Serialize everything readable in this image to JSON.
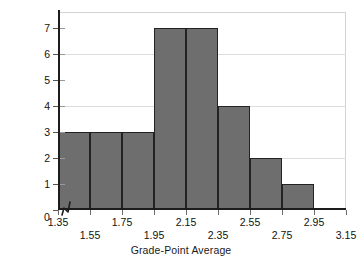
{
  "chart_data": {
    "type": "bar",
    "subtype": "histogram",
    "title": "",
    "xlabel": "Grade-Point Average",
    "ylabel": "Frequency f",
    "ylabel_subscript": "i",
    "categories": [
      "1.35-1.55",
      "1.55-1.75",
      "1.75-1.95",
      "1.95-2.15",
      "2.15-2.35",
      "2.35-2.55",
      "2.55-2.75",
      "2.75-2.95"
    ],
    "values": [
      3,
      3,
      3,
      7,
      7,
      4,
      2,
      1
    ],
    "bin_edges": [
      1.35,
      1.55,
      1.75,
      1.95,
      2.15,
      2.35,
      2.55,
      2.75,
      2.95
    ],
    "bin_width": 0.2,
    "xlim": [
      1.35,
      3.15
    ],
    "ylim": [
      0,
      7.6
    ],
    "xticks": [
      1.35,
      1.55,
      1.75,
      1.95,
      2.15,
      2.35,
      2.55,
      2.75,
      2.95,
      3.15
    ],
    "xticklabels": [
      "1.35",
      "1.55",
      "1.75",
      "1.95",
      "2.15",
      "2.35",
      "2.55",
      "2.75",
      "2.95",
      "3.15"
    ],
    "xticklabel_rows": [
      0,
      1,
      0,
      1,
      0,
      1,
      0,
      1,
      0,
      1
    ],
    "yticks": [
      0,
      1,
      2,
      3,
      4,
      5,
      6,
      7
    ],
    "yticklabels": [
      "0",
      "1",
      "2",
      "3",
      "4",
      "5",
      "6",
      "7"
    ],
    "gridlines_y": [
      2,
      4,
      6
    ],
    "grid": "horizontal-major",
    "legend": null,
    "axis_break": {
      "axis": "x",
      "symbol": "zigzag",
      "between": [
        0,
        1.35
      ]
    },
    "origin_label": "0",
    "colors": {
      "bar_fill": "#6e6e6e",
      "bar_edge": "#232323",
      "axis": "#1c1c1c",
      "grid": "#dcdcdc",
      "frame": "#d2d2d2",
      "text": "#111111",
      "background": "#ffffff"
    }
  }
}
